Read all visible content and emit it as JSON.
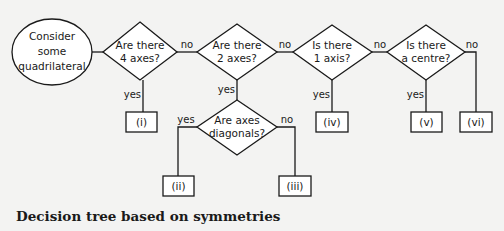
{
  "start": {
    "lines": [
      "Consider",
      "some",
      "quadrilateral"
    ]
  },
  "decisions": [
    {
      "id": "q1",
      "lines": [
        "Are there",
        "4 axes?"
      ]
    },
    {
      "id": "q2",
      "lines": [
        "Are there",
        "2 axes?"
      ]
    },
    {
      "id": "q3",
      "lines": [
        "Is there",
        "1 axis?"
      ]
    },
    {
      "id": "q4",
      "lines": [
        "Is there",
        "a centre?"
      ]
    },
    {
      "id": "q5",
      "lines": [
        "Are axes",
        "diagonals?"
      ]
    }
  ],
  "outcomes": [
    "(i)",
    "(ii)",
    "(iii)",
    "(iv)",
    "(v)",
    "(vi)"
  ],
  "edge_labels": {
    "yes": "yes",
    "no": "no"
  },
  "caption": "Decision tree based on symmetries"
}
